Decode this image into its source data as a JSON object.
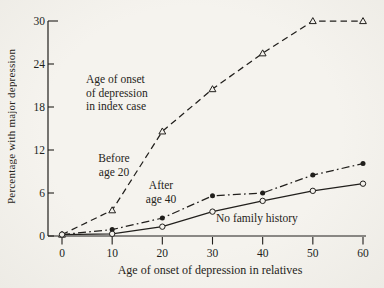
{
  "figure": {
    "paper_color": "#f3f1ec",
    "ink_color": "#211f1c"
  },
  "chart_data": {
    "type": "line",
    "title": "",
    "xlabel": "Age of onset of depression in relatives",
    "ylabel": "Percentage with major depression",
    "xlim": [
      0,
      60
    ],
    "ylim": [
      0,
      30
    ],
    "x_ticks": [
      0,
      10,
      20,
      30,
      40,
      50,
      60
    ],
    "y_ticks": [
      0,
      6,
      12,
      18,
      24,
      30
    ],
    "grid": false,
    "legend_position": "inline-annotations",
    "x": [
      0,
      10,
      20,
      30,
      40,
      50,
      60
    ],
    "series": [
      {
        "name": "Before age 20",
        "values": [
          0.2,
          3.6,
          14.6,
          20.5,
          25.5,
          30,
          30
        ],
        "line_style": "dashed",
        "marker": "open-triangle",
        "color": "#211f1c"
      },
      {
        "name": "After age 40",
        "values": [
          0.2,
          0.9,
          2.5,
          5.6,
          6.0,
          8.5,
          10.1
        ],
        "line_style": "dashdot",
        "marker": "filled-circle",
        "color": "#211f1c"
      },
      {
        "name": "No family history",
        "values": [
          0.2,
          0.3,
          1.3,
          3.4,
          4.9,
          6.3,
          7.3
        ],
        "line_style": "solid",
        "marker": "open-circle",
        "color": "#211f1c"
      }
    ]
  },
  "annotations": {
    "index_case": "Age of onset\nof depression\nin index case",
    "before_age_20": "Before\nage 20",
    "after_age_40": "After\nage 40",
    "no_family_history": "No family history"
  }
}
